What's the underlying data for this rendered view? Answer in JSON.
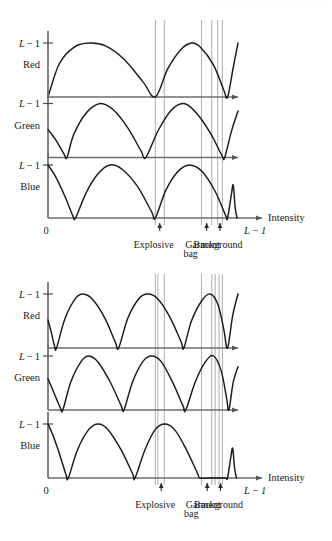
{
  "document": {
    "title": "RGB component intensity profiles"
  },
  "chart_data": [
    {
      "id": "top",
      "type": "line",
      "title": "",
      "xlabel": "Intensity",
      "ylabel": "",
      "axis_origin_label": "0",
      "axis_end_label": "L − 1",
      "xlim": [
        0,
        240
      ],
      "ylim": [
        0,
        1
      ],
      "grid": false,
      "legend_position": "none",
      "panels": [
        {
          "name": "Red",
          "level_label": "L − 1",
          "channel_label": "Red",
          "points": [
            [
              0.0,
              0.0
            ],
            [
              0.06,
              0.62
            ],
            [
              0.14,
              0.93
            ],
            [
              0.22,
              1.0
            ],
            [
              0.3,
              0.95
            ],
            [
              0.4,
              0.7
            ],
            [
              0.5,
              0.28
            ],
            [
              0.565,
              0.0
            ],
            [
              0.63,
              0.52
            ],
            [
              0.7,
              0.88
            ],
            [
              0.755,
              1.0
            ],
            [
              0.8,
              0.93
            ],
            [
              0.87,
              0.6
            ],
            [
              0.925,
              0.13
            ],
            [
              0.945,
              0.0
            ],
            [
              0.975,
              0.55
            ],
            [
              1.0,
              1.0
            ]
          ]
        },
        {
          "name": "Green",
          "level_label": "L − 1",
          "channel_label": "Green",
          "points": [
            [
              0.0,
              0.52
            ],
            [
              0.04,
              0.33
            ],
            [
              0.085,
              0.06
            ],
            [
              0.1,
              0.0
            ],
            [
              0.135,
              0.42
            ],
            [
              0.2,
              0.82
            ],
            [
              0.275,
              1.0
            ],
            [
              0.345,
              0.88
            ],
            [
              0.42,
              0.55
            ],
            [
              0.49,
              0.12
            ],
            [
              0.515,
              0.0
            ],
            [
              0.58,
              0.5
            ],
            [
              0.65,
              0.88
            ],
            [
              0.715,
              1.0
            ],
            [
              0.78,
              0.83
            ],
            [
              0.855,
              0.45
            ],
            [
              0.915,
              0.04
            ],
            [
              0.93,
              0.0
            ],
            [
              0.965,
              0.48
            ],
            [
              1.0,
              0.86
            ]
          ]
        },
        {
          "name": "Blue",
          "level_label": "L − 1",
          "channel_label": "Blue",
          "points": [
            [
              0.0,
              1.0
            ],
            [
              0.04,
              0.78
            ],
            [
              0.09,
              0.4
            ],
            [
              0.13,
              0.05
            ],
            [
              0.145,
              0.0
            ],
            [
              0.2,
              0.47
            ],
            [
              0.26,
              0.82
            ],
            [
              0.325,
              1.0
            ],
            [
              0.39,
              0.92
            ],
            [
              0.47,
              0.6
            ],
            [
              0.545,
              0.12
            ],
            [
              0.565,
              0.0
            ],
            [
              0.62,
              0.52
            ],
            [
              0.685,
              0.88
            ],
            [
              0.745,
              1.0
            ],
            [
              0.81,
              0.88
            ],
            [
              0.88,
              0.5
            ],
            [
              0.935,
              0.05
            ],
            [
              0.945,
              0.0
            ],
            [
              0.965,
              0.44
            ],
            [
              0.975,
              0.62
            ],
            [
              0.985,
              0.2
            ],
            [
              0.995,
              0.0
            ]
          ]
        }
      ],
      "guides": [
        0.565,
        0.612,
        0.808,
        0.862,
        0.893,
        0.918
      ],
      "regions": [
        {
          "label": "Explosive",
          "marker_x": 0.588
        },
        {
          "label": "Garment bag",
          "marker_x": 0.835
        },
        {
          "label": "Background",
          "marker_x": 0.905
        }
      ]
    },
    {
      "id": "bottom",
      "type": "line",
      "title": "",
      "xlabel": "Intensity",
      "ylabel": "",
      "axis_origin_label": "0",
      "axis_end_label": "L − 1",
      "xlim": [
        0,
        240
      ],
      "ylim": [
        0,
        1
      ],
      "grid": false,
      "legend_position": "none",
      "panels": [
        {
          "name": "Red",
          "level_label": "L − 1",
          "channel_label": "Red",
          "points": [
            [
              0.0,
              0.52
            ],
            [
              0.018,
              0.28
            ],
            [
              0.035,
              0.03
            ],
            [
              0.045,
              0.0
            ],
            [
              0.09,
              0.55
            ],
            [
              0.145,
              0.92
            ],
            [
              0.185,
              1.0
            ],
            [
              0.235,
              0.9
            ],
            [
              0.3,
              0.55
            ],
            [
              0.355,
              0.1
            ],
            [
              0.372,
              0.0
            ],
            [
              0.42,
              0.55
            ],
            [
              0.48,
              0.92
            ],
            [
              0.525,
              1.0
            ],
            [
              0.575,
              0.92
            ],
            [
              0.64,
              0.58
            ],
            [
              0.7,
              0.12
            ],
            [
              0.715,
              0.0
            ],
            [
              0.755,
              0.5
            ],
            [
              0.81,
              0.88
            ],
            [
              0.855,
              1.0
            ],
            [
              0.895,
              0.8
            ],
            [
              0.925,
              0.35
            ],
            [
              0.945,
              0.0
            ],
            [
              0.972,
              0.6
            ],
            [
              1.0,
              1.0
            ]
          ]
        },
        {
          "name": "Green",
          "level_label": "L − 1",
          "channel_label": "Green",
          "points": [
            [
              0.0,
              0.58
            ],
            [
              0.03,
              0.33
            ],
            [
              0.065,
              0.04
            ],
            [
              0.078,
              0.0
            ],
            [
              0.12,
              0.52
            ],
            [
              0.175,
              0.9
            ],
            [
              0.215,
              1.0
            ],
            [
              0.265,
              0.88
            ],
            [
              0.33,
              0.5
            ],
            [
              0.385,
              0.08
            ],
            [
              0.4,
              0.0
            ],
            [
              0.445,
              0.52
            ],
            [
              0.5,
              0.9
            ],
            [
              0.545,
              1.0
            ],
            [
              0.595,
              0.9
            ],
            [
              0.655,
              0.52
            ],
            [
              0.71,
              0.08
            ],
            [
              0.725,
              0.0
            ],
            [
              0.775,
              0.52
            ],
            [
              0.83,
              0.9
            ],
            [
              0.872,
              1.0
            ],
            [
              0.912,
              0.72
            ],
            [
              0.94,
              0.22
            ],
            [
              0.952,
              0.0
            ],
            [
              0.975,
              0.52
            ],
            [
              1.0,
              0.8
            ]
          ]
        },
        {
          "name": "Blue",
          "level_label": "L − 1",
          "channel_label": "Blue",
          "points": [
            [
              0.0,
              1.0
            ],
            [
              0.025,
              0.8
            ],
            [
              0.06,
              0.45
            ],
            [
              0.095,
              0.06
            ],
            [
              0.107,
              0.0
            ],
            [
              0.155,
              0.52
            ],
            [
              0.215,
              0.9
            ],
            [
              0.265,
              1.0
            ],
            [
              0.315,
              0.9
            ],
            [
              0.385,
              0.52
            ],
            [
              0.445,
              0.08
            ],
            [
              0.458,
              0.0
            ],
            [
              0.51,
              0.52
            ],
            [
              0.565,
              0.9
            ],
            [
              0.615,
              1.0
            ],
            [
              0.665,
              0.9
            ],
            [
              0.725,
              0.55
            ],
            [
              0.785,
              0.1
            ],
            [
              0.8,
              0.0
            ],
            [
              0.845,
              0.0
            ],
            [
              0.89,
              0.0
            ],
            [
              0.935,
              0.0
            ],
            [
              0.945,
              0.0
            ],
            [
              0.962,
              0.38
            ],
            [
              0.972,
              0.55
            ],
            [
              0.982,
              0.18
            ],
            [
              0.992,
              0.0
            ]
          ]
        }
      ],
      "guides": [
        0.565,
        0.578,
        0.612,
        0.808,
        0.862,
        0.88,
        0.9,
        0.918
      ],
      "regions": [
        {
          "label": "Explosive",
          "marker_x": 0.596
        },
        {
          "label": "Garment bag",
          "marker_x": 0.838
        },
        {
          "label": "Background",
          "marker_x": 0.908
        }
      ]
    }
  ],
  "colors": {
    "curve": "#1a1a1a",
    "axis": "#6e6e6e",
    "guide": "#b5b5b5",
    "text": "#1a1a1a"
  }
}
